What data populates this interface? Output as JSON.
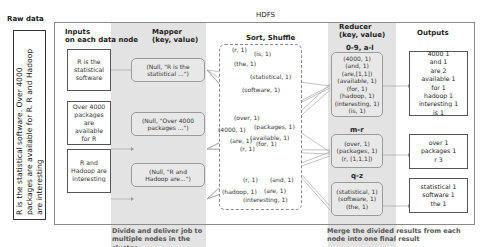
{
  "labels": {
    "raw_data": "Raw data",
    "hdfs": "HDFS",
    "inputs": "Inputs",
    "inputs_sub": "on each data node",
    "mapper": "Mapper",
    "mapper_sub": "(key, value)",
    "sort_shuffle": "Sort, Shuffle",
    "reducer": "Reducer",
    "reducer_sub": "(key, value)",
    "outputs": "Outputs"
  },
  "raw_text": "R is the statistical software. Over 4000 packages are available for R. R and Hadoop are interesting",
  "inputs": [
    {
      "text": "R is the statistical software"
    },
    {
      "text": "Over 4000 packages are available for R"
    },
    {
      "text": "R and Hadoop are interesting"
    }
  ],
  "mappers": [
    {
      "text": "(Null, \"R is the statistical ...\")"
    },
    {
      "text": "(Null, \"Over 4000 packages ...\")"
    },
    {
      "text": "(Null, \"R and Hadoop are...\")"
    }
  ],
  "shuffle": {
    "group1": [
      "(r, 1)",
      "(is, 1)",
      "(the, 1)",
      "(statistical, 1)",
      "(software, 1)"
    ],
    "group2": [
      "(over, 1)",
      "(4000, 1)",
      "(packages, 1)",
      "(are, 1)",
      "(available, 1)",
      "(r, 1)",
      "(for, 1)"
    ],
    "group3": [
      "(r, 1)",
      "(and, 1)",
      "(hadoop, 1)",
      "(are, 1)",
      "(interesting, 1)"
    ]
  },
  "reducers": [
    {
      "range": "0-9, a-l",
      "items": [
        "(4000, 1)",
        "(and, 1)",
        "(are,[1,1])",
        "(available, 1)",
        "(for, 1)",
        "(hadoop, 1)",
        "(interesting, 1)",
        "(is, 1)"
      ]
    },
    {
      "range": "m-r",
      "items": [
        "(over, 1)",
        "(packages, 1)",
        "(r, [1,1,1])"
      ]
    },
    {
      "range": "q-z",
      "items": [
        "(statistical, 1)",
        "(software, 1)",
        "(the, 1)"
      ]
    }
  ],
  "outputs": [
    {
      "lines": [
        "4000 1",
        "and 1",
        "are 2",
        "available 1",
        "for 1",
        "hadoop 1",
        "interesting 1",
        "is 1"
      ]
    },
    {
      "lines": [
        "over 1",
        "packages 1",
        "r 3"
      ]
    },
    {
      "lines": [
        "statistical 1",
        "software 1",
        "the 1"
      ]
    }
  ],
  "captions": {
    "map": "Divide and deliver job to multiple nodes in the cluster",
    "reduce": "Merge the divided results from each node into one final result"
  },
  "colors": {
    "band": "#e3e3e3",
    "box_border": "#555555",
    "line": "#9a9a9a"
  }
}
